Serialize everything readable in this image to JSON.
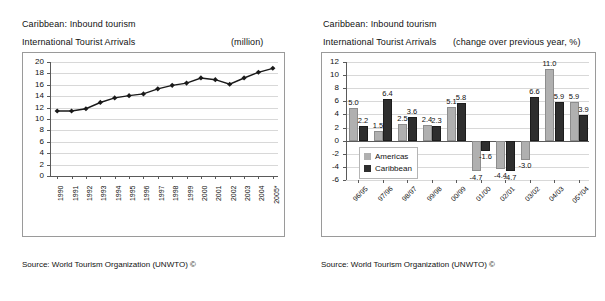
{
  "left_panel": {
    "title_line1": "Caribbean: Inbound tourism",
    "title_line2": "International Tourist Arrivals",
    "unit": "(million)",
    "source": "Source: World Tourism Organization (UNWTO) ©"
  },
  "right_panel": {
    "title_line1": "Caribbean: Inbound tourism",
    "title_line2": "International Tourist Arrivals",
    "unit": "(change over previous year, %)",
    "source": "Source: World Tourism Organization (UNWTO) ©"
  },
  "chart_data": [
    {
      "id": "arrivals-line",
      "type": "line",
      "title": "Caribbean: Inbound tourism — International Tourist Arrivals",
      "xlabel": "",
      "ylabel": "",
      "unit": "million",
      "grid": true,
      "legend": "none",
      "ylim": [
        0,
        20
      ],
      "yticks": [
        0,
        2,
        4,
        6,
        8,
        10,
        12,
        14,
        16,
        18,
        20
      ],
      "categories": [
        "1990",
        "1991",
        "1992",
        "1993",
        "1994",
        "1995",
        "1996",
        "1997",
        "1998",
        "1999",
        "2000",
        "2001",
        "2002",
        "2003",
        "2004",
        "2005*"
      ],
      "values": [
        11.4,
        11.4,
        11.8,
        12.9,
        13.7,
        14.1,
        14.4,
        15.3,
        15.9,
        16.3,
        17.2,
        16.9,
        16.1,
        17.2,
        18.2,
        18.9
      ],
      "marker": "diamond",
      "series_color": "#1a1a1a"
    },
    {
      "id": "arrivals-change-bar",
      "type": "bar",
      "title": "Caribbean: Inbound tourism — International Tourist Arrivals",
      "xlabel": "",
      "ylabel": "",
      "unit": "change over previous year, %",
      "grid": true,
      "legend": "inside-left",
      "ylim": [
        -6,
        12
      ],
      "yticks": [
        -6,
        -4,
        -2,
        0,
        2,
        4,
        6,
        8,
        10,
        12
      ],
      "categories": [
        "96/95",
        "97/96",
        "98/97",
        "99/98",
        "00/99",
        "01/00",
        "02/01",
        "03/02",
        "04/03",
        "05*/04"
      ],
      "series": [
        {
          "name": "Americas",
          "color": "#b0b0b0",
          "values": [
            5.0,
            1.5,
            2.5,
            2.4,
            5.1,
            -4.7,
            -4.4,
            -3.0,
            11.0,
            5.9
          ]
        },
        {
          "name": "Caribbean",
          "color": "#2e2e2e",
          "values": [
            2.2,
            6.4,
            3.6,
            2.3,
            5.8,
            -1.6,
            -4.7,
            6.6,
            5.9,
            3.9
          ]
        }
      ],
      "data_labels": {
        "Americas": [
          "5.0",
          "1.5",
          "2.5",
          "2.4",
          "5.1",
          "-4.7",
          "-4.4",
          "-3.0",
          "11.0",
          "5.9"
        ],
        "Caribbean": [
          "2.2",
          "6.4",
          "3.6",
          "2.3",
          "5.8",
          "-1.6",
          "-4.7",
          "6.6",
          "5.9",
          "3.9"
        ]
      }
    }
  ]
}
